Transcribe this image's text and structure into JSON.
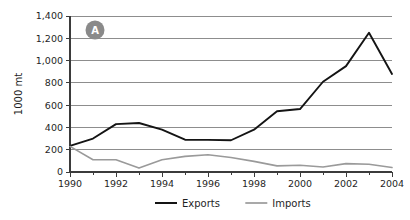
{
  "chart_data": {
    "type": "line",
    "title": "",
    "panel_label": "A",
    "xlabel": "",
    "ylabel": "1000 mt",
    "x": [
      1990,
      1991,
      1992,
      1993,
      1994,
      1995,
      1996,
      1997,
      1998,
      1999,
      2000,
      2001,
      2002,
      2003,
      2004
    ],
    "xlim": [
      1990,
      2004
    ],
    "ylim": [
      0,
      1400
    ],
    "ytick_labels": [
      "0",
      "200",
      "400",
      "600",
      "800",
      "1,000",
      "1,200",
      "1,400"
    ],
    "ytick_values": [
      0,
      200,
      400,
      600,
      800,
      1000,
      1200,
      1400
    ],
    "xtick_labels": [
      "1990",
      "1992",
      "1994",
      "1996",
      "1998",
      "2000",
      "2002",
      "2004"
    ],
    "xtick_values": [
      1990,
      1992,
      1994,
      1996,
      1998,
      2000,
      2002,
      2004
    ],
    "xminor_values": [
      1991,
      1993,
      1995,
      1997,
      1999,
      2001,
      2003
    ],
    "grid": "horizontal",
    "legend_position": "bottom",
    "series": [
      {
        "name": "Exports",
        "color": "#141414",
        "values": [
          235,
          300,
          430,
          440,
          380,
          290,
          288,
          285,
          380,
          545,
          565,
          810,
          950,
          1250,
          880
        ]
      },
      {
        "name": "Imports",
        "color": "#9a9a9a",
        "values": [
          230,
          110,
          110,
          35,
          110,
          140,
          155,
          130,
          95,
          55,
          60,
          45,
          75,
          70,
          40
        ]
      }
    ]
  }
}
